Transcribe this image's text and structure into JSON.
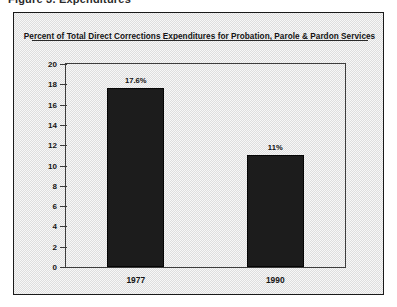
{
  "page": {
    "top_cut_text": "Figure 3.  Expenditures",
    "background_color": "#ededed",
    "border_color": "#1a1a1a"
  },
  "chart_data": {
    "type": "bar",
    "title": "Percent of Total Direct Corrections Expenditures for Probation, Parole & Pardon Services",
    "xlabel": "",
    "ylabel": "",
    "categories": [
      "1977",
      "1990"
    ],
    "values": [
      17.6,
      11
    ],
    "value_labels": [
      "17.6%",
      "11%"
    ],
    "ylim": [
      0,
      20
    ],
    "ytick_values": [
      20,
      18,
      16,
      14,
      12,
      10,
      8,
      6,
      4,
      2,
      0
    ],
    "ytick_labels": [
      "20",
      "18",
      "16",
      "14",
      "12",
      "10",
      "8",
      "6",
      "4",
      "2",
      "0"
    ],
    "grid": false,
    "legend": false,
    "bar_color": "#1c1c1c"
  }
}
